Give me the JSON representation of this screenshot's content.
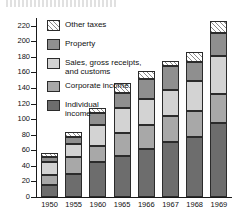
{
  "figure": {
    "top_fragment": "",
    "background": "#ffffff"
  },
  "legend": {
    "position": "inside-top-left",
    "items": [
      {
        "key": "other",
        "label": "Other  taxes",
        "color": "#ffffff",
        "pattern": "diagonal-hatch"
      },
      {
        "key": "property",
        "label": "Property",
        "color": "#8f8f8f",
        "pattern": "solid"
      },
      {
        "key": "sales",
        "label": "Sales, gross receipts,\nand customs",
        "color": "#d3d3d3",
        "pattern": "solid"
      },
      {
        "key": "corporate",
        "label": "Corporate income",
        "color": "#a8a8a8",
        "pattern": "solid"
      },
      {
        "key": "individual",
        "label": "Individual\nincome",
        "color": "#6d6d6d",
        "pattern": "solid"
      }
    ]
  },
  "axis": {
    "y_ticks": [
      "0",
      "20",
      "40",
      "60",
      "80",
      "100",
      "120",
      "140",
      "160",
      "180",
      "200",
      "220"
    ],
    "x_ticks": [
      "1950",
      "1955",
      "1960",
      "1965",
      "1966",
      "1967",
      "1968",
      "1969"
    ]
  },
  "chart_data": {
    "type": "bar",
    "stacked": true,
    "title": "",
    "subtitle": "",
    "xlabel": "",
    "ylabel": "",
    "ylim": [
      0,
      230
    ],
    "ytick_step": 20,
    "grid": false,
    "legend_position": "inside-top-left",
    "categories": [
      "1950",
      "1955",
      "1960",
      "1965",
      "1966",
      "1967",
      "1968",
      "1969"
    ],
    "series": [
      {
        "name": "Individual income",
        "color": "#6d6d6d",
        "pattern": "solid",
        "values": [
          16,
          29,
          45,
          53,
          62,
          71,
          77,
          95
        ]
      },
      {
        "name": "Corporate income",
        "color": "#a8a8a8",
        "pattern": "solid",
        "values": [
          12,
          23,
          20,
          29,
          31,
          33,
          34,
          38
        ]
      },
      {
        "name": "Sales, gross receipts, and customs",
        "color": "#d3d3d3",
        "pattern": "solid",
        "values": [
          17,
          16,
          27,
          32,
          33,
          33,
          38,
          48
        ]
      },
      {
        "name": "Property",
        "color": "#8f8f8f",
        "pattern": "solid",
        "values": [
          6,
          9,
          16,
          20,
          26,
          31,
          24,
          30
        ]
      },
      {
        "name": "Other taxes",
        "color": "#ffffff",
        "pattern": "diagonal-hatch",
        "values": [
          5,
          7,
          6,
          12,
          10,
          7,
          13,
          15
        ]
      }
    ],
    "cumulative_tops": {
      "1950": [
        16,
        28,
        45,
        51,
        56
      ],
      "1955": [
        29,
        52,
        68,
        77,
        84
      ],
      "1960": [
        45,
        65,
        92,
        108,
        114
      ],
      "1965": [
        53,
        82,
        114,
        134,
        146
      ],
      "1966": [
        62,
        93,
        126,
        152,
        162
      ],
      "1967": [
        71,
        104,
        137,
        168,
        175
      ],
      "1968": [
        77,
        111,
        149,
        173,
        186
      ],
      "1969": [
        95,
        133,
        181,
        211,
        226
      ]
    },
    "totals": [
      56,
      84,
      114,
      146,
      162,
      175,
      186,
      226
    ]
  }
}
